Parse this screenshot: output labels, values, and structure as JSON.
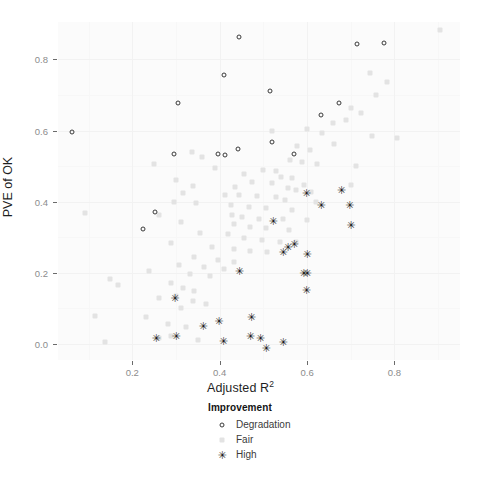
{
  "chart_data": {
    "type": "scatter",
    "title": "",
    "xlabel": "Adjusted R²",
    "xlabel_base": "Adjusted R",
    "xlabel_sup": "2",
    "ylabel": "PVE of OK",
    "xlim": [
      0.03,
      0.95
    ],
    "ylim": [
      -0.045,
      0.905
    ],
    "xticks": [
      "0.2",
      "0.4",
      "0.6",
      "0.8"
    ],
    "xtick_values": [
      0.2,
      0.4,
      0.6,
      0.8
    ],
    "yticks": [
      "0.0",
      "0.2",
      "0.4",
      "0.6",
      "0.8"
    ],
    "ytick_values": [
      0.0,
      0.2,
      0.4,
      0.6,
      0.8
    ],
    "grid": true,
    "legend_position": "bottom",
    "legend_title": "Improvement",
    "colors": {
      "degradation": "#3a3a3a",
      "fair": "#e3e3e3",
      "high": "#1a1a1a",
      "panel_background": "#fbfbfb",
      "grid_major": "#f2f2f2",
      "grid_minor": "#f7f7f7",
      "tick_text": "#8c8c8c",
      "axis_title": "#1f1f1f"
    },
    "series": [
      {
        "name": "Degradation",
        "marker": "open-circle",
        "points": [
          [
            0.445,
            0.862
          ],
          [
            0.715,
            0.843
          ],
          [
            0.775,
            0.845
          ],
          [
            0.41,
            0.755
          ],
          [
            0.515,
            0.71
          ],
          [
            0.305,
            0.678
          ],
          [
            0.672,
            0.678
          ],
          [
            0.632,
            0.645
          ],
          [
            0.062,
            0.595
          ],
          [
            0.52,
            0.568
          ],
          [
            0.443,
            0.548
          ],
          [
            0.295,
            0.535
          ],
          [
            0.396,
            0.535
          ],
          [
            0.412,
            0.532
          ],
          [
            0.57,
            0.533
          ],
          [
            0.252,
            0.37
          ],
          [
            0.225,
            0.322
          ]
        ]
      },
      {
        "name": "Fair",
        "marker": "light-square",
        "points": [
          [
            0.905,
            0.883
          ],
          [
            0.743,
            0.763
          ],
          [
            0.782,
            0.735
          ],
          [
            0.757,
            0.7
          ],
          [
            0.7,
            0.662
          ],
          [
            0.723,
            0.648
          ],
          [
            0.69,
            0.63
          ],
          [
            0.66,
            0.622
          ],
          [
            0.6,
            0.605
          ],
          [
            0.52,
            0.6
          ],
          [
            0.635,
            0.593
          ],
          [
            0.748,
            0.585
          ],
          [
            0.805,
            0.578
          ],
          [
            0.662,
            0.562
          ],
          [
            0.576,
            0.556
          ],
          [
            0.606,
            0.545
          ],
          [
            0.336,
            0.54
          ],
          [
            0.36,
            0.525
          ],
          [
            0.56,
            0.518
          ],
          [
            0.589,
            0.512
          ],
          [
            0.623,
            0.505
          ],
          [
            0.712,
            0.5
          ],
          [
            0.25,
            0.505
          ],
          [
            0.39,
            0.495
          ],
          [
            0.5,
            0.488
          ],
          [
            0.53,
            0.485
          ],
          [
            0.455,
            0.478
          ],
          [
            0.54,
            0.47
          ],
          [
            0.566,
            0.466
          ],
          [
            0.3,
            0.46
          ],
          [
            0.475,
            0.455
          ],
          [
            0.52,
            0.452
          ],
          [
            0.592,
            0.448
          ],
          [
            0.7,
            0.448
          ],
          [
            0.34,
            0.445
          ],
          [
            0.435,
            0.44
          ],
          [
            0.556,
            0.438
          ],
          [
            0.575,
            0.432
          ],
          [
            0.608,
            0.428
          ],
          [
            0.316,
            0.425
          ],
          [
            0.412,
            0.42
          ],
          [
            0.445,
            0.418
          ],
          [
            0.486,
            0.415
          ],
          [
            0.528,
            0.412
          ],
          [
            0.55,
            0.405
          ],
          [
            0.62,
            0.4
          ],
          [
            0.296,
            0.398
          ],
          [
            0.345,
            0.395
          ],
          [
            0.425,
            0.39
          ],
          [
            0.468,
            0.385
          ],
          [
            0.505,
            0.382
          ],
          [
            0.566,
            0.378
          ],
          [
            0.092,
            0.368
          ],
          [
            0.262,
            0.362
          ],
          [
            0.428,
            0.362
          ],
          [
            0.452,
            0.358
          ],
          [
            0.49,
            0.352
          ],
          [
            0.545,
            0.35
          ],
          [
            0.6,
            0.348
          ],
          [
            0.312,
            0.342
          ],
          [
            0.432,
            0.338
          ],
          [
            0.47,
            0.33
          ],
          [
            0.507,
            0.325
          ],
          [
            0.558,
            0.32
          ],
          [
            0.355,
            0.312
          ],
          [
            0.42,
            0.308
          ],
          [
            0.455,
            0.298
          ],
          [
            0.498,
            0.292
          ],
          [
            0.538,
            0.288
          ],
          [
            0.575,
            0.288
          ],
          [
            0.288,
            0.283
          ],
          [
            0.382,
            0.272
          ],
          [
            0.432,
            0.266
          ],
          [
            0.47,
            0.262
          ],
          [
            0.508,
            0.258
          ],
          [
            0.342,
            0.245
          ],
          [
            0.396,
            0.235
          ],
          [
            0.433,
            0.23
          ],
          [
            0.308,
            0.222
          ],
          [
            0.364,
            0.215
          ],
          [
            0.41,
            0.212
          ],
          [
            0.238,
            0.205
          ],
          [
            0.332,
            0.198
          ],
          [
            0.378,
            0.192
          ],
          [
            0.148,
            0.182
          ],
          [
            0.288,
            0.172
          ],
          [
            0.168,
            0.165
          ],
          [
            0.315,
            0.158
          ],
          [
            0.342,
            0.148
          ],
          [
            0.3,
            0.135
          ],
          [
            0.262,
            0.128
          ],
          [
            0.34,
            0.12
          ],
          [
            0.368,
            0.112
          ],
          [
            0.312,
            0.1
          ],
          [
            0.114,
            0.078
          ],
          [
            0.232,
            0.075
          ],
          [
            0.282,
            0.055
          ],
          [
            0.322,
            0.048
          ],
          [
            0.288,
            0.022
          ],
          [
            0.138,
            0.005
          ],
          [
            0.262,
            0.018
          ],
          [
            0.35,
            0.012
          ]
        ]
      },
      {
        "name": "High",
        "marker": "filled-star",
        "points": [
          [
            0.598,
            0.425
          ],
          [
            0.678,
            0.432
          ],
          [
            0.632,
            0.392
          ],
          [
            0.697,
            0.39
          ],
          [
            0.7,
            0.335
          ],
          [
            0.522,
            0.346
          ],
          [
            0.57,
            0.282
          ],
          [
            0.556,
            0.272
          ],
          [
            0.545,
            0.258
          ],
          [
            0.6,
            0.252
          ],
          [
            0.445,
            0.205
          ],
          [
            0.592,
            0.2
          ],
          [
            0.6,
            0.2
          ],
          [
            0.598,
            0.152
          ],
          [
            0.297,
            0.128
          ],
          [
            0.472,
            0.075
          ],
          [
            0.398,
            0.065
          ],
          [
            0.362,
            0.05
          ],
          [
            0.254,
            0.018
          ],
          [
            0.3,
            0.023
          ],
          [
            0.47,
            0.022
          ],
          [
            0.493,
            0.017
          ],
          [
            0.545,
            0.005
          ],
          [
            0.408,
            0.008
          ],
          [
            0.506,
            -0.012
          ]
        ]
      }
    ]
  },
  "legend": {
    "title": "Improvement",
    "items": [
      {
        "label": "Degradation",
        "marker": "open-circle"
      },
      {
        "label": "Fair",
        "marker": "light-square"
      },
      {
        "label": "High",
        "marker": "filled-star"
      }
    ]
  },
  "axes": {
    "x_title_base": "Adjusted R",
    "x_title_sup": "2",
    "y_title": "PVE of OK"
  }
}
